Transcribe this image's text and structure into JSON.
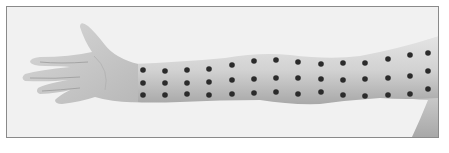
{
  "image": {
    "subject": "arm-with-marker-dot-grid",
    "description": "Photograph of an outstretched left arm, palm up, with a grid of dark dots marked along the forearm and upper arm",
    "colors": {
      "background": "#f1f1f1",
      "border": "#8a8a8a",
      "skin_light": "#dcdcdc",
      "skin_mid": "#c4c4c4",
      "skin_shadow": "#9e9e9e",
      "dot": "#2b2b2b"
    },
    "dot_grid": {
      "rows": 3,
      "columns": 14,
      "columns_x": [
        143,
        165,
        187,
        209,
        232,
        254,
        276,
        298,
        321,
        343,
        365,
        388,
        410,
        428
      ],
      "rows_y": [
        [
          70,
          83,
          95
        ],
        [
          71,
          83,
          95
        ],
        [
          70,
          83,
          94
        ],
        [
          69,
          82,
          95
        ],
        [
          65,
          80,
          94
        ],
        [
          61,
          79,
          93
        ],
        [
          60,
          78,
          92
        ],
        [
          62,
          78,
          94
        ],
        [
          64,
          79,
          92
        ],
        [
          63,
          80,
          95
        ],
        [
          63,
          79,
          96
        ],
        [
          59,
          78,
          95
        ],
        [
          55,
          76,
          94
        ],
        [
          53,
          71,
          89
        ]
      ]
    }
  }
}
